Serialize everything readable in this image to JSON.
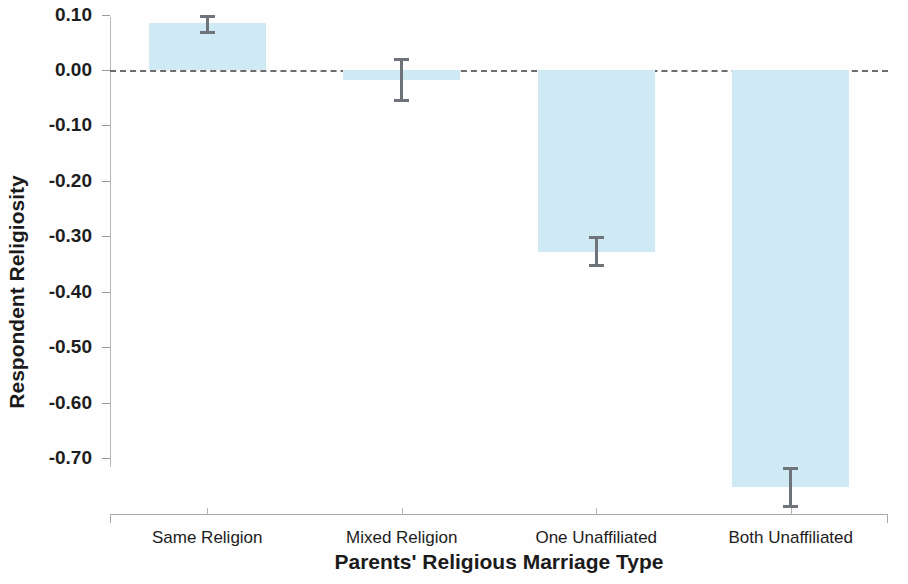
{
  "chart_data": {
    "type": "bar",
    "title": "",
    "xlabel": "Parents' Religious Marriage Type",
    "ylabel": "Respondent Religiosity",
    "categories": [
      "Same Religion",
      "Mixed Religion",
      "One Unaffiliated",
      "Both Unaffiliated"
    ],
    "values": [
      0.085,
      -0.018,
      -0.328,
      -0.753
    ],
    "errors_low": [
      0.065,
      -0.058,
      -0.355,
      -0.79
    ],
    "errors_high": [
      0.1,
      0.022,
      -0.3,
      -0.717
    ],
    "ylim": [
      -0.78,
      0.12
    ],
    "yticks": [
      0.1,
      0.0,
      -0.1,
      -0.2,
      -0.3,
      -0.4,
      -0.5,
      -0.6,
      -0.7
    ],
    "ytick_labels": [
      "0.10",
      "0.00",
      "-0.10",
      "-0.20",
      "-0.30",
      "-0.40",
      "-0.50",
      "-0.60",
      "-0.70"
    ],
    "grid": false,
    "legend": "none",
    "bar_color": "#cfe9f5",
    "error_color": "#6f737a",
    "zero_line": {
      "value": 0.0,
      "style": "dashed",
      "color": "#6d6d6d"
    }
  }
}
